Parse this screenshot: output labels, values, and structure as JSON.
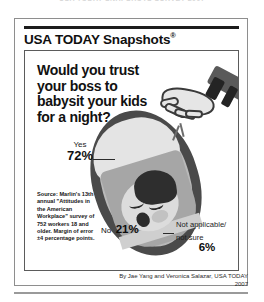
{
  "top_caption": "USA TODAY SNAPSHOTS SURVEY 2007",
  "brand": {
    "name": "USA TODAY Snapshots",
    "registered_mark": "®"
  },
  "question": "Would you trust your boss to babysit your kids for a night?",
  "chart_data": {
    "type": "pie",
    "title": "Would you trust your boss to babysit your kids for a night?",
    "categories": [
      "Yes",
      "No",
      "Not applicable/ not sure"
    ],
    "values": [
      72,
      21,
      6
    ],
    "value_labels": [
      "72%",
      "21%",
      "6%"
    ],
    "unit": "percent",
    "xlabel": "",
    "ylabel": "",
    "legend": "inline-callouts",
    "grid": false,
    "note": "Illustration-style infographic; percentages shown as callout labels around a bassinet graphic."
  },
  "labels": {
    "yes": {
      "name": "Yes",
      "value": "72%"
    },
    "no": {
      "name": "No",
      "value": "21%"
    },
    "not_applicable": {
      "name": "Not applicable/ not sure",
      "line1": "Not applicable/",
      "line2": "not sure",
      "value": "6%"
    }
  },
  "source": "Source: Marlin's 13th annual \"Attitudes in the American Workplace\" survey of 752 workers 18 and older. Margin of error ±4 percentage points.",
  "byline": {
    "credit": "By Jae Yang and Veronica Salazar, USA TODAY",
    "year": "2007"
  },
  "colors": {
    "ink": "#111111",
    "frame": "#8e8e8e",
    "bassinet_border": "#4a4a4a",
    "blanket": "#a6a6a6",
    "hood": "#e4e4e4",
    "hair": "#2e2e2e",
    "cuff": "#242424"
  },
  "icons": {
    "hand": "reaching-hand-icon",
    "baby": "sleeping-baby-icon",
    "bassinet": "bassinet-icon",
    "rattle": "rattle-icon"
  }
}
